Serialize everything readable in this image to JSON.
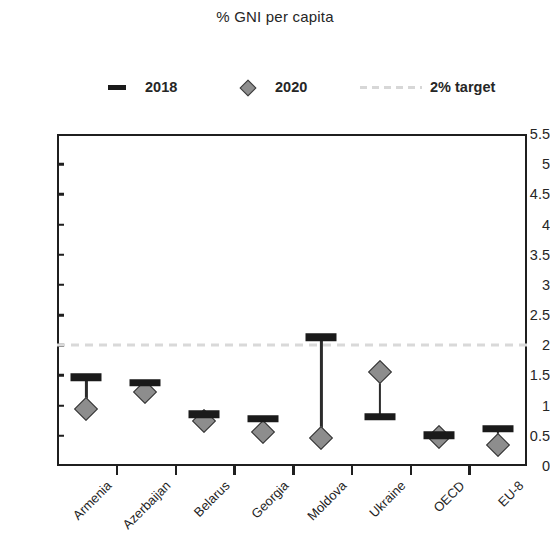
{
  "chart_data": {
    "type": "scatter",
    "title": "% GNI per capita",
    "xlabel": "",
    "ylabel": "",
    "ylim": [
      0,
      5.5
    ],
    "ytick_step": 0.5,
    "yticks": [
      "5.5",
      "5",
      "4.5",
      "4",
      "3.5",
      "3",
      "2.5",
      "2",
      "1.5",
      "1",
      "0.5",
      "0"
    ],
    "grid": false,
    "legend_position": "top",
    "categories": [
      "Armenia",
      "Azerbaijan",
      "Belarus",
      "Georgia",
      "Moldova",
      "Ukraine",
      "OECD",
      "EU-8"
    ],
    "series": [
      {
        "name": "2018",
        "marker": "dash",
        "color": "#1a1a1a",
        "values": [
          1.47,
          1.38,
          0.86,
          0.78,
          2.13,
          0.82,
          0.51,
          0.62
        ]
      },
      {
        "name": "2020",
        "marker": "diamond",
        "color": "#8d8d8d",
        "values": [
          0.95,
          1.22,
          0.74,
          0.56,
          0.46,
          1.55,
          0.48,
          0.35
        ]
      }
    ],
    "reference_lines": [
      {
        "label": "2% target",
        "value": 2,
        "style": "dashed",
        "color": "#d9d9d9"
      }
    ]
  },
  "legend": {
    "entries": [
      {
        "label": "2018",
        "marker": "dash-marker-icon"
      },
      {
        "label": "2020",
        "marker": "diamond-marker-icon"
      },
      {
        "label": "2% target",
        "marker": "dashed-line-icon"
      }
    ]
  }
}
